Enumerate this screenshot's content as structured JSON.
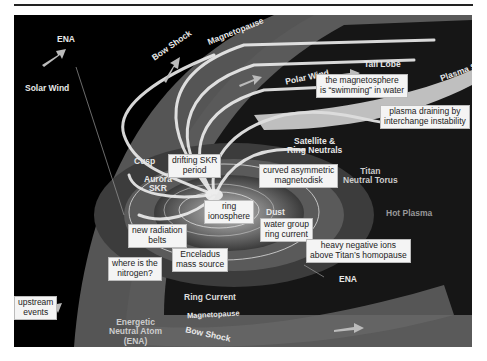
{
  "diagram": {
    "region_labels": {
      "ena_top": "ENA",
      "solar_wind": "Solar Wind",
      "bow_shock_top": "Bow Shock",
      "magnetopause_top": "Magnetopause",
      "tail_lobe": "Tail Lobe",
      "polar_wind": "Polar Wind",
      "plasma_sheet": "Plasma Sheet",
      "satellite_ring_neutrals_1": "Satellite &",
      "satellite_ring_neutrals_2": "Ring Neutrals",
      "cusp": "Cusp",
      "aurora_skr_1": "Aurora",
      "aurora_skr_2": "SKR",
      "titan_torus_1": "Titan",
      "titan_torus_2": "Neutral Torus",
      "dust": "Dust",
      "hot_plasma": "Hot Plasma",
      "ring_current": "Ring Current",
      "ena_bottom": "ENA",
      "ena_full_1": "Energetic",
      "ena_full_2": "Neutral Atom",
      "ena_full_3": "(ENA)",
      "bow_shock_bottom": "Bow Shock",
      "magnetopause_bottom": "Magnetopause"
    },
    "callouts": {
      "swimming_1": "the magnetosphere",
      "swimming_2": "is “swimming” in water",
      "draining_1": "plasma draining by",
      "draining_2": "interchange instability",
      "skr_period_1": "drifting SKR",
      "skr_period_2": "period",
      "magnetodisk_1": "curved asymmetric",
      "magnetodisk_2": "magnetodisk",
      "ring_iono_1": "ring",
      "ring_iono_2": "ionosphere",
      "water_group_1": "water group",
      "water_group_2": "ring current",
      "radiation_belts_1": "new radiation",
      "radiation_belts_2": "belts",
      "enceladus_1": "Enceladus",
      "enceladus_2": "mass source",
      "neg_ions_1": "heavy negative ions",
      "neg_ions_2": "above Titan’s homopause",
      "nitrogen_1": "where is the",
      "nitrogen_2": "nitrogen?",
      "upstream_1": "upstream",
      "upstream_2": "events"
    },
    "colors": {
      "background": "#000000",
      "sheath": "#8a8a8a",
      "field_lines": "#f0f0f0",
      "disk": "#6e6e6e",
      "callout_bg": "#f4f4f4"
    }
  }
}
